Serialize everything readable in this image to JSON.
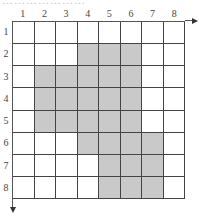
{
  "header": {
    "cutoff_text": "…………………"
  },
  "grid": {
    "rows": 8,
    "cols": 8,
    "col_labels": [
      "1",
      "2",
      "3",
      "4",
      "5",
      "6",
      "7",
      "8"
    ],
    "row_labels": [
      "1",
      "2",
      "3",
      "4",
      "5",
      "6",
      "7",
      "8"
    ],
    "shaded": [
      [],
      [
        4,
        5,
        6
      ],
      [
        2,
        3,
        4,
        5,
        6
      ],
      [
        2,
        3,
        4,
        5,
        6
      ],
      [
        2,
        3,
        4,
        5,
        6
      ],
      [
        4,
        5,
        6,
        7
      ],
      [
        5,
        6,
        7
      ],
      [
        5,
        6,
        7
      ]
    ],
    "shade_color": "#c9c9c9",
    "line_color": "#444444"
  },
  "axes": {
    "x_arrow": "right",
    "y_arrow": "down"
  }
}
